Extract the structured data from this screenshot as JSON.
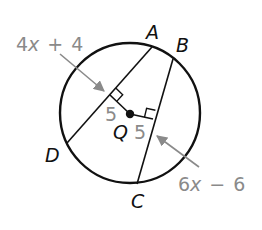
{
  "figure": {
    "type": "circle-chords-geometry",
    "center": {
      "label": "Q"
    },
    "points": [
      {
        "label": "A"
      },
      {
        "label": "B"
      },
      {
        "label": "C"
      },
      {
        "label": "D"
      }
    ],
    "chords": [
      {
        "name": "AD",
        "length_expression": {
          "coef": "4",
          "var": "x",
          "op": "+",
          "const": "4"
        },
        "distance_from_center": "5"
      },
      {
        "name": "BC",
        "length_expression": {
          "coef": "6",
          "var": "x",
          "op": "−",
          "const": "6"
        },
        "distance_from_center": "5"
      }
    ],
    "markers": [
      "right-angle",
      "right-angle"
    ],
    "colors": {
      "lines": "#111111",
      "annotations": "#8a8a8a",
      "background": "#ffffff"
    }
  }
}
